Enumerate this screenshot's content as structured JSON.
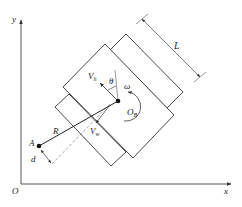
{
  "diagram": {
    "axes": {
      "origin": "O",
      "x": "x",
      "y": "y"
    },
    "labels": {
      "length": "L",
      "vh_main": "V",
      "vh_sub": "h",
      "theta": "θ",
      "omega": "ω",
      "ob_main": "O",
      "ob_sub": "B",
      "radius": "R",
      "vw_main": "V",
      "vw_sub": "w",
      "point_a": "A",
      "offset_d": "d"
    },
    "colors": {
      "stroke": "#333333",
      "dashed": "#888888",
      "background": "#ffffff"
    }
  }
}
